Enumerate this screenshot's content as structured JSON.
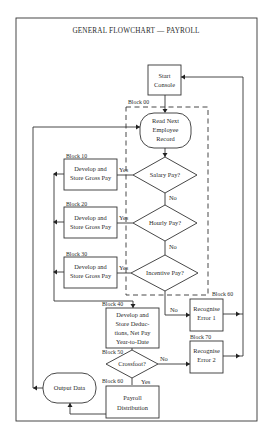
{
  "title": "GENERAL FLOWCHART — PAYROLL",
  "nodes": {
    "start": {
      "lines": [
        "Start",
        "Console"
      ]
    },
    "read": {
      "block": "Block 00",
      "lines": [
        "Read Next",
        "Employee",
        "Record"
      ]
    },
    "salary": {
      "lines": [
        "Salary Pay?"
      ]
    },
    "hourly": {
      "lines": [
        "Hourly Pay?"
      ]
    },
    "incentive": {
      "lines": [
        "Incentive Pay?"
      ]
    },
    "b10": {
      "block": "Block 10",
      "lines": [
        "Develop and",
        "Store Gross Pay"
      ]
    },
    "b20": {
      "block": "Block 20",
      "lines": [
        "Develop and",
        "Store Gross Pay"
      ]
    },
    "b30": {
      "block": "Block 30",
      "lines": [
        "Develop and",
        "Store Gross Pay"
      ]
    },
    "b40": {
      "block": "Block 40",
      "lines": [
        "Develop and",
        "Store Deduc-",
        "tions, Net Pay",
        "Year-to-Date"
      ]
    },
    "err1": {
      "block": "Block 60",
      "lines": [
        "Recognise",
        "Error 1"
      ]
    },
    "err2": {
      "block": "Block 70",
      "lines": [
        "Recognise",
        "Error 2"
      ]
    },
    "crossfoot": {
      "block": "Block 50",
      "lines": [
        "Crossfoot?"
      ]
    },
    "b60": {
      "block": "Block 60",
      "lines": [
        "Payroll",
        "Distribution"
      ]
    },
    "output": {
      "lines": [
        "Output Data"
      ]
    }
  },
  "edges": {
    "yes": "Yes",
    "no": "No"
  }
}
